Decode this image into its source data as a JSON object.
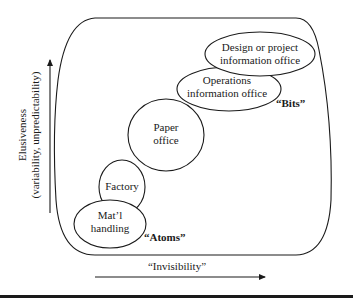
{
  "diagram": {
    "y_axis": {
      "label_line1": "Elusiveness",
      "label_line2": "(variability, unpredictability)"
    },
    "x_axis": {
      "label": "“Invisibility”"
    },
    "annotations": {
      "atoms": "“Atoms”",
      "bits": "“Bits”"
    },
    "nodes": [
      {
        "id": "matl-handling",
        "line1": "Mat’l",
        "line2": "handling"
      },
      {
        "id": "factory",
        "line1": "Factory",
        "line2": ""
      },
      {
        "id": "paper-office",
        "line1": "Paper",
        "line2": "office"
      },
      {
        "id": "operations-information-office",
        "line1": "Operations",
        "line2": "information office"
      },
      {
        "id": "design-project-information-office",
        "line1": "Design or project",
        "line2": "information office"
      }
    ]
  }
}
